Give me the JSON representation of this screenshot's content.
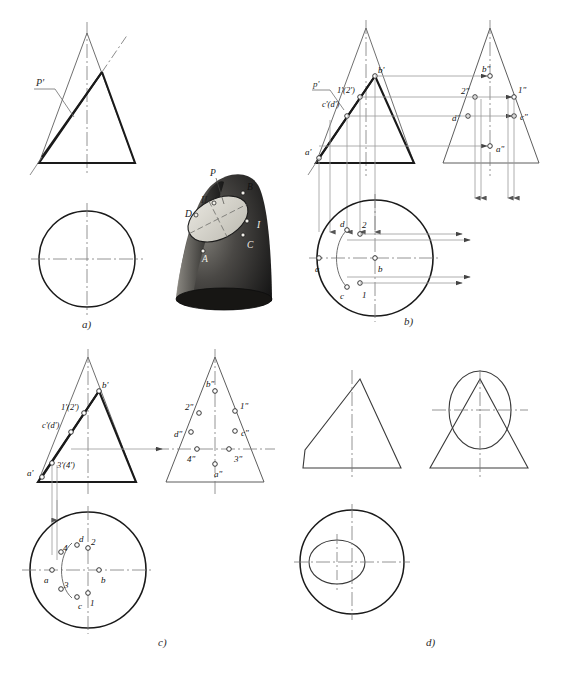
{
  "figure": {
    "panels": [
      {
        "id": "a",
        "caption": "a)",
        "description": "Front view with cutting plane P' and plan view circle, plus pictorial cone"
      },
      {
        "id": "b",
        "caption": "b)",
        "description": "Locating principal points a,b,c,d and 1,2 by projection"
      },
      {
        "id": "c",
        "caption": "c)",
        "description": "Adding intermediate points 3,4 and completing the ellipse in plan"
      },
      {
        "id": "d",
        "caption": "d)",
        "description": "Finished three-view drawing of the truncated cone"
      }
    ]
  },
  "panel_a": {
    "caption": "a)",
    "cutting_plane_label": "P'",
    "pictorial": {
      "labels": {
        "plane": "P",
        "point_B": "B",
        "point_D": "D",
        "point_A": "A",
        "point_C": "C",
        "gen_I": "I",
        "gen_II": "II"
      }
    }
  },
  "panel_b": {
    "caption": "b)",
    "front_view_labels": [
      "p'",
      "1'(2')",
      "c'(d')",
      "a'",
      "b'"
    ],
    "side_view_labels": [
      "b\"",
      "2\"",
      "1\"",
      "d\"",
      "c\"",
      "a\""
    ],
    "plan_view_labels": [
      "a",
      "b",
      "c",
      "d",
      "1",
      "2"
    ]
  },
  "panel_c": {
    "caption": "c)",
    "front_view_labels": [
      "a'",
      "b'",
      "1'(2')",
      "c'(d')",
      "3'(4')"
    ],
    "side_view_labels": [
      "b\"",
      "2\"",
      "1\"",
      "d\"",
      "c\"",
      "4\"",
      "3\"",
      "a\""
    ],
    "plan_view_labels": [
      "a",
      "b",
      "c",
      "d",
      "1",
      "2",
      "3",
      "4"
    ]
  },
  "panel_d": {
    "caption": "d)",
    "views": [
      "front view",
      "side view",
      "plan view"
    ]
  },
  "style": {
    "outline_color": "#1a1a1a",
    "thin_color": "#3d3d3d",
    "projection_color": "#8a8a8a",
    "center_line_color": "#7a7a7a",
    "cone_dark": "#2b2b2b",
    "cone_light": "#d8d6cf"
  }
}
